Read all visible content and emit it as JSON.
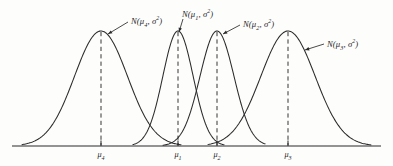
{
  "figure": {
    "background_color": "#fdfdfc",
    "ink_color": "#2b2b2b"
  },
  "chart_data": {
    "type": "line",
    "title": "",
    "subtitle": "",
    "xlabel": "",
    "ylabel": "",
    "grid": false,
    "legend_position": "inline-annotations",
    "axis": {
      "x_start_px": 12,
      "x_end_px": 381,
      "baseline_y_px": 146,
      "show_y_axis": false,
      "tick_direction": "up"
    },
    "series": [
      {
        "name": "N(mu4, sigma^2)",
        "label_text": "N(μ4, σ²)",
        "mean_label": "μ4",
        "mean_x_px": 101,
        "peak_y_px": 31,
        "left_base_px": 22,
        "right_base_px": 181,
        "label_x_px": 131,
        "label_y_px": 15,
        "leader_from_x_px": 128,
        "leader_from_y_px": 22,
        "leader_to_x_px": 108,
        "leader_to_y_px": 34
      },
      {
        "name": "N(mu1, sigma^2)",
        "label_text": "N(μ1, σ²)",
        "mean_label": "μ1",
        "mean_x_px": 178,
        "peak_y_px": 31,
        "left_base_px": 133,
        "right_base_px": 224,
        "label_x_px": 182,
        "label_y_px": 8,
        "leader_from_x_px": 183,
        "leader_from_y_px": 19,
        "leader_to_x_px": 179,
        "leader_to_y_px": 32
      },
      {
        "name": "N(mu2, sigma^2)",
        "label_text": "N(μ2, σ²)",
        "mean_label": "μ2",
        "mean_x_px": 217,
        "peak_y_px": 31,
        "left_base_px": 163,
        "right_base_px": 265,
        "label_x_px": 243,
        "label_y_px": 18,
        "leader_from_x_px": 240,
        "leader_from_y_px": 25,
        "leader_to_x_px": 223,
        "leader_to_y_px": 34
      },
      {
        "name": "N(mu3, sigma^2)",
        "label_text": "N(μ3, σ²)",
        "mean_label": "μ3",
        "mean_x_px": 288,
        "peak_y_px": 31,
        "left_base_px": 208,
        "right_base_px": 371,
        "label_x_px": 327,
        "label_y_px": 38,
        "leader_from_x_px": 324,
        "leader_from_y_px": 44,
        "leader_to_x_px": 305,
        "leader_to_y_px": 50
      }
    ],
    "x_ticks": [
      {
        "label": "μ4",
        "x_px": 101
      },
      {
        "label": "μ1",
        "x_px": 178
      },
      {
        "label": "μ2",
        "x_px": 217
      },
      {
        "label": "μ3",
        "x_px": 288
      }
    ],
    "annotations": [
      "N(μ4, σ²)",
      "N(μ1, σ²)",
      "N(μ2, σ²)",
      "N(μ3, σ²)"
    ]
  },
  "labels": {
    "curve_4": {
      "head": "N(",
      "mu": "μ",
      "sub": "4",
      "comma": ", ",
      "sigma": "σ",
      "sup": "2",
      "tail": ")"
    },
    "curve_1": {
      "head": "N(",
      "mu": "μ",
      "sub": "1",
      "comma": ", ",
      "sigma": "σ",
      "sup": "2",
      "tail": ")"
    },
    "curve_2": {
      "head": "N(",
      "mu": "μ",
      "sub": "2",
      "comma": ", ",
      "sigma": "σ",
      "sup": "2",
      "tail": ")"
    },
    "curve_3": {
      "head": "N(",
      "mu": "μ",
      "sub": "3",
      "comma": ", ",
      "sigma": "σ",
      "sup": "2",
      "tail": ")"
    }
  },
  "ticks": {
    "t0": {
      "mu": "μ",
      "sub": "4"
    },
    "t1": {
      "mu": "μ",
      "sub": "1"
    },
    "t2": {
      "mu": "μ",
      "sub": "2"
    },
    "t3": {
      "mu": "μ",
      "sub": "3"
    }
  }
}
